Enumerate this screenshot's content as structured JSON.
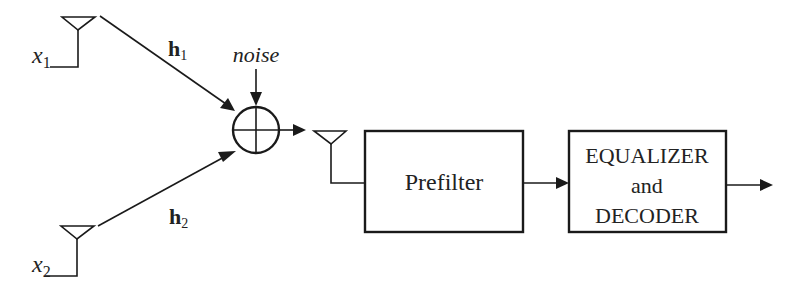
{
  "diagram": {
    "type": "block-diagram",
    "colors": {
      "stroke": "#1a1a1a",
      "text": "#222222",
      "background": "#ffffff"
    },
    "transmitters": [
      {
        "id": "tx1",
        "symbol": "x",
        "subscript": "1",
        "icon": "antenna-icon"
      },
      {
        "id": "tx2",
        "symbol": "x",
        "subscript": "2",
        "icon": "antenna-icon"
      }
    ],
    "channels": [
      {
        "id": "h1",
        "symbol": "h",
        "subscript": "1",
        "from": "tx1",
        "to": "sum"
      },
      {
        "id": "h2",
        "symbol": "h",
        "subscript": "2",
        "from": "tx2",
        "to": "sum"
      }
    ],
    "noise": {
      "label": "noise",
      "to": "sum"
    },
    "summer": {
      "id": "sum",
      "icon": "adder-icon"
    },
    "receiver": {
      "icon": "antenna-icon"
    },
    "blocks": [
      {
        "id": "prefilter",
        "lines": [
          "Prefilter"
        ]
      },
      {
        "id": "equalizer",
        "lines": [
          "EQUALIZER",
          "and",
          "DECODER"
        ]
      }
    ],
    "edges": [
      {
        "from": "sum",
        "to": "rx-antenna"
      },
      {
        "from": "rx-antenna",
        "to": "prefilter"
      },
      {
        "from": "prefilter",
        "to": "equalizer"
      },
      {
        "from": "equalizer",
        "to": "output"
      }
    ]
  }
}
